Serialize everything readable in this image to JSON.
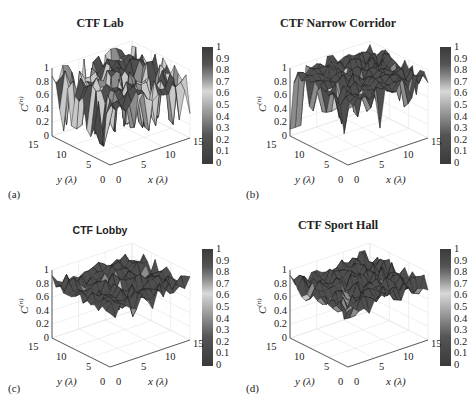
{
  "chart_data": [
    {
      "type": "surface3d",
      "panel_label": "(a)",
      "title": "CTF Lab",
      "xlabel": "x (λ)",
      "ylabel": "y (λ)",
      "zlabel": "C(n)",
      "xlim": [
        0,
        15
      ],
      "ylim": [
        0,
        15
      ],
      "zlim": [
        0,
        1
      ],
      "xticks": [
        0,
        5,
        10,
        15
      ],
      "yticks": [
        0,
        5,
        10,
        15
      ],
      "zticks": [
        0,
        0.2,
        0.4,
        0.6,
        0.8,
        1
      ],
      "colorbar": {
        "range": [
          0,
          1
        ],
        "ticks": [
          0,
          0.1,
          0.2,
          0.3,
          0.4,
          0.5,
          0.6,
          0.7,
          0.8,
          0.9,
          1
        ]
      },
      "grid": true,
      "description": "Surface mostly between 0.7 and 1 with many deep dips down to ~0.1-0.4"
    },
    {
      "type": "surface3d",
      "panel_label": "(b)",
      "title": "CTF Narrow Corridor",
      "xlabel": "x (λ)",
      "ylabel": "y (λ)",
      "zlabel": "C(n)",
      "xlim": [
        0,
        15
      ],
      "ylim": [
        0,
        15
      ],
      "zlim": [
        0,
        1
      ],
      "xticks": [
        0,
        5,
        10,
        15
      ],
      "yticks": [
        0,
        5,
        10,
        15
      ],
      "zticks": [
        0,
        0.2,
        0.4,
        0.6,
        0.8,
        1
      ],
      "colorbar": {
        "range": [
          0,
          1
        ],
        "ticks": [
          0,
          0.1,
          0.2,
          0.3,
          0.4,
          0.5,
          0.6,
          0.7,
          0.8,
          0.9,
          1
        ]
      },
      "grid": true,
      "description": "Surface mostly ~0.85-1 with a sharp drop to ~0.1 at one edge and several dips to ~0.4"
    },
    {
      "type": "surface3d",
      "panel_label": "(c)",
      "title": "CTF Lobby",
      "xlabel": "x (λ)",
      "ylabel": "y (λ)",
      "zlabel": "C(n)",
      "xlim": [
        0,
        15
      ],
      "ylim": [
        0,
        15
      ],
      "zlim": [
        0,
        1
      ],
      "xticks": [
        0,
        5,
        10,
        15
      ],
      "yticks": [
        0,
        5,
        10,
        15
      ],
      "zticks": [
        0,
        0.2,
        0.4,
        0.6,
        0.8,
        1
      ],
      "colorbar": {
        "range": [
          0,
          1
        ],
        "ticks": [
          0,
          0.1,
          0.2,
          0.3,
          0.4,
          0.5,
          0.6,
          0.7,
          0.8,
          0.9,
          1
        ]
      },
      "grid": true,
      "description": "Fairly flat surface ~0.7-0.95 with a few dips to ~0.5"
    },
    {
      "type": "surface3d",
      "panel_label": "(d)",
      "title": "CTF Sport Hall",
      "xlabel": "x (λ)",
      "ylabel": "y (λ)",
      "zlabel": "C(n)",
      "xlim": [
        0,
        15
      ],
      "ylim": [
        0,
        15
      ],
      "zlim": [
        0,
        1
      ],
      "xticks": [
        0,
        5,
        10,
        15
      ],
      "yticks": [
        0,
        5,
        10,
        15
      ],
      "zticks": [
        0,
        0.2,
        0.4,
        0.6,
        0.8,
        1
      ],
      "colorbar": {
        "range": [
          0,
          1
        ],
        "ticks": [
          0,
          0.1,
          0.2,
          0.3,
          0.4,
          0.5,
          0.6,
          0.7,
          0.8,
          0.9,
          1
        ]
      },
      "grid": true,
      "description": "Fairly flat surface ~0.65-0.95"
    }
  ],
  "colorbar_ticks": [
    "1",
    "0.9",
    "0.8",
    "0.7",
    "0.6",
    "0.5",
    "0.4",
    "0.3",
    "0.2",
    "0.1",
    "0"
  ],
  "zticks": [
    "1",
    "0.8",
    "0.6",
    "0.4",
    "0.2",
    "0"
  ],
  "labels": {
    "x": "x (λ)",
    "y": "y (λ)",
    "z": "C",
    "zsup": "(n)"
  },
  "ticks": {
    "t0": "0",
    "t5": "5",
    "t10": "10",
    "t15": "15"
  },
  "panels": [
    {
      "title": "CTF Lab",
      "label": "(a)"
    },
    {
      "title": "CTF Narrow Corridor",
      "label": "(b)"
    },
    {
      "title": "CTF Lobby",
      "label": "(c)"
    },
    {
      "title": "CTF Sport Hall",
      "label": "(d)"
    }
  ]
}
